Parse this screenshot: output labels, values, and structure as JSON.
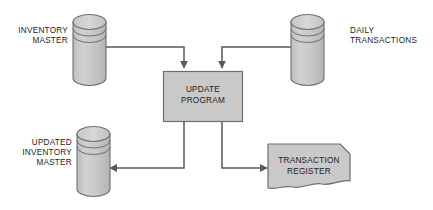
{
  "diagram": {
    "type": "data-flow-diagram",
    "background_color": "#ffffff",
    "shape_fill": "#c9c9c9",
    "shape_stroke": "#6e6e6e",
    "connector_color": "#5a5a5a",
    "text_color": "#1c1c1c",
    "nodes": [
      {
        "id": "inventory-master",
        "shape": "cylinder",
        "label_lines": [
          "INVENTORY",
          "MASTER"
        ],
        "label_position": "left"
      },
      {
        "id": "daily-transactions",
        "shape": "cylinder",
        "label_lines": [
          "DAILY",
          "TRANSACTIONS"
        ],
        "label_position": "right"
      },
      {
        "id": "update-program",
        "shape": "process-rectangle",
        "label_lines": [
          "UPDATE",
          "PROGRAM"
        ],
        "label_position": "inside"
      },
      {
        "id": "updated-inventory-master",
        "shape": "cylinder",
        "label_lines": [
          "UPDATED",
          "INVENTORY",
          "MASTER"
        ],
        "label_position": "left"
      },
      {
        "id": "transaction-register",
        "shape": "document",
        "label_lines": [
          "TRANSACTION",
          "REGISTER"
        ],
        "label_position": "inside"
      }
    ],
    "connectors": [
      {
        "id": "inventory-master-to-update-program",
        "from": "inventory-master",
        "to": "update-program",
        "direction": "down"
      },
      {
        "id": "daily-transactions-to-update-program",
        "from": "daily-transactions",
        "to": "update-program",
        "direction": "down"
      },
      {
        "id": "update-program-to-updated-inventory-master",
        "from": "update-program",
        "to": "updated-inventory-master",
        "direction": "left"
      },
      {
        "id": "update-program-to-transaction-register",
        "from": "update-program",
        "to": "transaction-register",
        "direction": "right"
      }
    ]
  },
  "labels": {
    "inventory_master_line1": "INVENTORY",
    "inventory_master_line2": "MASTER",
    "daily_transactions_line1": "DAILY",
    "daily_transactions_line2": "TRANSACTIONS",
    "update_program_line1": "UPDATE",
    "update_program_line2": "PROGRAM",
    "updated_inventory_line1": "UPDATED",
    "updated_inventory_line2": "INVENTORY",
    "updated_inventory_line3": "MASTER",
    "transaction_register_line1": "TRANSACTION",
    "transaction_register_line2": "REGISTER"
  }
}
